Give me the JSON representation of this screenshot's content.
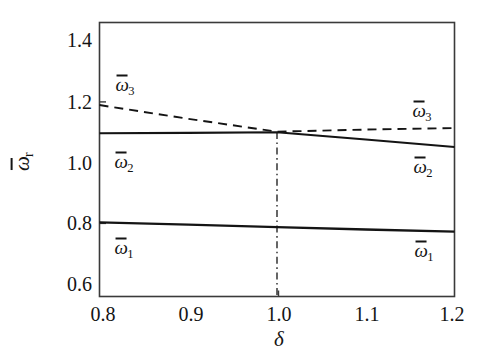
{
  "chart_data": {
    "type": "line",
    "title": "",
    "subtitle": "",
    "xlabel": "δ",
    "ylabel": "ω̄r",
    "xlim": [
      0.8,
      1.2
    ],
    "ylim": [
      0.552,
      1.468
    ],
    "xticks": [
      0.8,
      0.9,
      1.0,
      1.1,
      1.2
    ],
    "xticklabels": [
      "0.8",
      "0.9",
      "1.0",
      "1.1",
      "1.2"
    ],
    "yticks": [
      0.6,
      0.8,
      1.0,
      1.2,
      1.4
    ],
    "yticklabels": [
      "0.6",
      "0.8",
      "1.0",
      "1.2",
      "1.4"
    ],
    "grid": false,
    "legend": "none",
    "frame": "box",
    "x": [
      0.8,
      0.9,
      1.0,
      1.1,
      1.2
    ],
    "series": [
      {
        "name": "ω̄1",
        "label": "ω̄1",
        "style": "solid",
        "color": "#141414",
        "values": [
          0.8,
          0.792,
          0.784,
          0.776,
          0.769
        ]
      },
      {
        "name": "ω̄2",
        "label": "ω̄2",
        "style": "solid",
        "color": "#141414",
        "values": [
          1.098,
          1.099,
          1.101,
          1.077,
          1.052
        ]
      },
      {
        "name": "ω̄3",
        "label": "ω̄3",
        "style": "dashed",
        "color": "#141414",
        "values": [
          1.192,
          1.146,
          1.103,
          1.11,
          1.115
        ]
      }
    ],
    "annotations": [
      {
        "type": "vertical-dashdot-line",
        "x": 1.0,
        "y_from": 0.552,
        "y_to": 1.102,
        "style": "dash-dot",
        "color": "#141414"
      }
    ]
  },
  "axes": {
    "y_ticks": [
      {
        "label": "1.4",
        "value": 1.4
      },
      {
        "label": "1.2",
        "value": 1.2
      },
      {
        "label": "1.0",
        "value": 1.0
      },
      {
        "label": "0.8",
        "value": 0.8
      },
      {
        "label": "0.6",
        "value": 0.6
      }
    ],
    "x_ticks": [
      {
        "label": "0.8",
        "value": 0.8
      },
      {
        "label": "0.9",
        "value": 0.9
      },
      {
        "label": "1.0",
        "value": 1.0
      },
      {
        "label": "1.1",
        "value": 1.1
      },
      {
        "label": "1.2",
        "value": 1.2
      }
    ],
    "x_title": "δ",
    "y_title_symbol": "ω",
    "y_title_subscript": "r"
  },
  "curve_labels": {
    "omega3_left": {
      "symbol": "ω",
      "subscript": "3"
    },
    "omega3_right": {
      "symbol": "ω",
      "subscript": "3"
    },
    "omega2_left": {
      "symbol": "ω",
      "subscript": "2"
    },
    "omega2_right": {
      "symbol": "ω",
      "subscript": "2"
    },
    "omega1_left": {
      "symbol": "ω",
      "subscript": "1"
    },
    "omega1_right": {
      "symbol": "ω",
      "subscript": "1"
    }
  },
  "colors": {
    "line": "#141414",
    "frame": "#3a3a3a",
    "background": "#ffffff"
  }
}
